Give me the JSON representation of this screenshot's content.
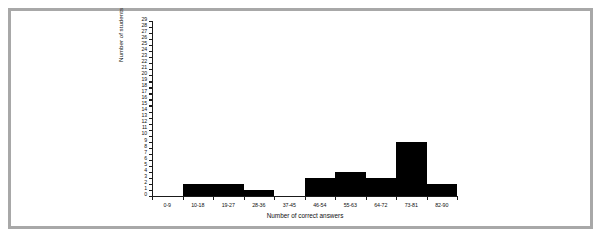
{
  "chart_data": {
    "type": "bar",
    "title": "",
    "subtitle": "",
    "xlabel": "Number of correct answers",
    "ylabel": "Number of students",
    "categories": [
      "0-9",
      "10-18",
      "19-27",
      "28-36",
      "37-45",
      "46-54",
      "55-63",
      "64-72",
      "73-81",
      "82-90"
    ],
    "values": [
      0,
      2,
      2,
      1,
      0,
      3,
      4,
      3,
      9,
      2
    ],
    "ylim": [
      0,
      29
    ],
    "y_tick_step": 1,
    "y_tick_labels": [
      "0",
      "1",
      "2",
      "3",
      "4",
      "5",
      "6",
      "7",
      "8",
      "9",
      "10",
      "11",
      "12",
      "13",
      "14",
      "15",
      "16",
      "17",
      "18",
      "19",
      "20",
      "21",
      "22",
      "23",
      "24",
      "25",
      "26",
      "27",
      "28",
      "29"
    ],
    "grid": false,
    "legend": null,
    "legend_position": "none",
    "bar_color": "#000000",
    "axis_color": "#1a1a1a",
    "frame_color": "#a8a8a8",
    "background_color": "#ffffff"
  }
}
